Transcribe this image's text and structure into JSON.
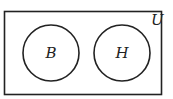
{
  "diagram": {
    "type": "venn",
    "universe_label": "U",
    "sets": [
      {
        "label": "B"
      },
      {
        "label": "H"
      }
    ],
    "relationship": "disjoint",
    "stroke_color": "#222222",
    "background_color": "#ffffff"
  }
}
